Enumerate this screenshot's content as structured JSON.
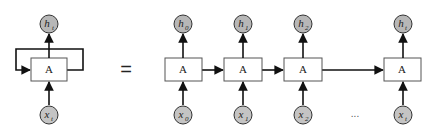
{
  "diagram": {
    "colors": {
      "node_fill": "#b7b7b7",
      "stroke": "#222222",
      "box_fill": "#ffffff"
    },
    "folded": {
      "cell_label": "A",
      "output": {
        "base": "h",
        "sub": "t"
      },
      "input": {
        "base": "x",
        "sub": "t"
      }
    },
    "equals": "=",
    "unrolled": [
      {
        "cell_label": "A",
        "output": {
          "base": "h",
          "sub": "0"
        },
        "input": {
          "base": "x",
          "sub": "0"
        }
      },
      {
        "cell_label": "A",
        "output": {
          "base": "h",
          "sub": "1"
        },
        "input": {
          "base": "x",
          "sub": "1"
        }
      },
      {
        "cell_label": "A",
        "output": {
          "base": "h",
          "sub": "2"
        },
        "input": {
          "base": "x",
          "sub": "2"
        }
      },
      {
        "cell_label": "A",
        "output": {
          "base": "h",
          "sub": "t"
        },
        "input": {
          "base": "x",
          "sub": "t"
        }
      }
    ],
    "ellipsis": "..."
  }
}
